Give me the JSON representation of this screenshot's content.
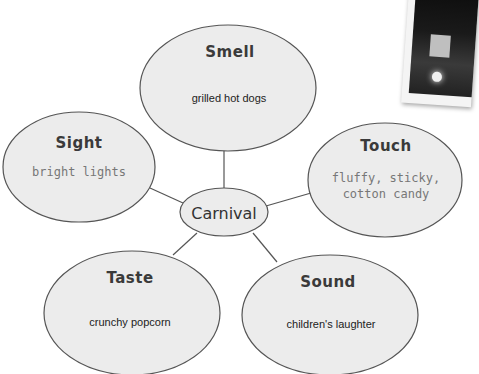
{
  "diagram": {
    "center": {
      "label": "Carnival"
    },
    "nodes": [
      {
        "id": "smell",
        "title": "Smell",
        "detail": "grilled hot dogs"
      },
      {
        "id": "sight",
        "title": "Sight",
        "detail": "bright lights"
      },
      {
        "id": "touch",
        "title": "Touch",
        "detail_line1": "fluffy, sticky,",
        "detail_line2": "cotton candy"
      },
      {
        "id": "taste",
        "title": "Taste",
        "detail": "crunchy popcorn"
      },
      {
        "id": "sound",
        "title": "Sound",
        "detail": "children's laughter"
      }
    ]
  },
  "colors": {
    "ellipse_fill": "#ececec",
    "ellipse_stroke": "#555555",
    "connector": "#555555"
  }
}
